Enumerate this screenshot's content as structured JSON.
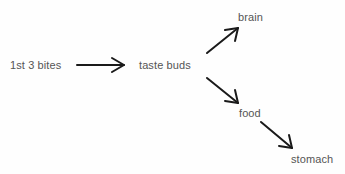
{
  "diagram": {
    "type": "flow",
    "colors": {
      "text": "#555555",
      "arrow": "#1a1a1a",
      "background": "#fefefe"
    },
    "nodes": [
      {
        "id": "bites",
        "label": "1st 3 bites"
      },
      {
        "id": "taste",
        "label": "taste buds"
      },
      {
        "id": "brain",
        "label": "brain"
      },
      {
        "id": "food",
        "label": "food"
      },
      {
        "id": "stomach",
        "label": "stomach"
      }
    ],
    "edges": [
      {
        "from": "bites",
        "to": "taste"
      },
      {
        "from": "taste",
        "to": "brain"
      },
      {
        "from": "taste",
        "to": "food"
      },
      {
        "from": "food",
        "to": "stomach"
      }
    ]
  }
}
